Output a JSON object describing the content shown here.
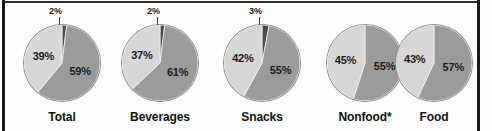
{
  "chart_data": {
    "type": "pie",
    "title": "",
    "subtitle": "",
    "xlabel": "",
    "ylabel": "",
    "legend_position": "none",
    "grid": false,
    "series_names": [
      "Share A",
      "Share B",
      "Share C"
    ],
    "colors": {
      "dark": "#4a4a4a",
      "medium": "#9b9b9b",
      "light": "#d7d7d7",
      "outline": "#8e8e8e",
      "text": "#111111",
      "border": "#1a1a1a"
    },
    "panels": [
      {
        "label": "Total",
        "callout": "2%",
        "callout_value": 2,
        "slices": [
          {
            "value": 2,
            "label": "2%",
            "tone": "dark",
            "labeled_inside": false
          },
          {
            "value": 59,
            "label": "59%",
            "tone": "medium",
            "labeled_inside": true
          },
          {
            "value": 39,
            "label": "39%",
            "tone": "light",
            "labeled_inside": true
          }
        ]
      },
      {
        "label": "Beverages",
        "callout": "2%",
        "callout_value": 2,
        "slices": [
          {
            "value": 2,
            "label": "2%",
            "tone": "dark",
            "labeled_inside": false
          },
          {
            "value": 61,
            "label": "61%",
            "tone": "medium",
            "labeled_inside": true
          },
          {
            "value": 37,
            "label": "37%",
            "tone": "light",
            "labeled_inside": true
          }
        ]
      },
      {
        "label": "Snacks",
        "callout": "3%",
        "callout_value": 3,
        "slices": [
          {
            "value": 3,
            "label": "3%",
            "tone": "dark",
            "labeled_inside": false
          },
          {
            "value": 55,
            "label": "55%",
            "tone": "medium",
            "labeled_inside": true
          },
          {
            "value": 42,
            "label": "42%",
            "tone": "light",
            "labeled_inside": true
          }
        ]
      },
      {
        "label": "Nonfood*",
        "callout": "",
        "callout_value": 0,
        "slices": [
          {
            "value": 55,
            "label": "55%",
            "tone": "medium",
            "labeled_inside": true
          },
          {
            "value": 45,
            "label": "45%",
            "tone": "light",
            "labeled_inside": true
          }
        ]
      },
      {
        "label": "Food",
        "callout": "",
        "callout_value": 0,
        "slices": [
          {
            "value": 57,
            "label": "57%",
            "tone": "medium",
            "labeled_inside": true
          },
          {
            "value": 43,
            "label": "43%",
            "tone": "light",
            "labeled_inside": true
          }
        ]
      }
    ]
  }
}
